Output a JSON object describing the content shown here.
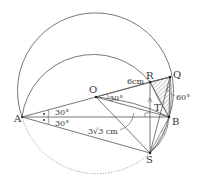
{
  "diagram": {
    "points": {
      "A": "A",
      "O": "O",
      "R": "R",
      "Q": "Q",
      "B": "B",
      "S": "S",
      "T": "T"
    },
    "labels": {
      "length_OR": "6cm",
      "length_OB_arc": "3√3 cm",
      "angle_ROB": "30°",
      "angle_OAB": "30°",
      "angle_BAS": "30°",
      "angle_Q": "60°"
    },
    "colors": {
      "line": "#555555",
      "dotted": "#888888",
      "hatch": "#666666",
      "text": "#333333"
    }
  }
}
